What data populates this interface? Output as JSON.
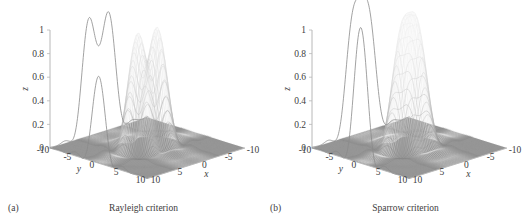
{
  "figure": {
    "panels": [
      {
        "id": "a",
        "letter": "(a)",
        "title": "Rayleigh criterion",
        "axes": {
          "z": {
            "label": "z",
            "ticks": [
              "0",
              "0.2",
              "0.4",
              "0.6",
              "0.8",
              "1"
            ],
            "values": [
              0,
              0.2,
              0.4,
              0.6,
              0.8,
              1
            ]
          },
          "y": {
            "label": "y",
            "ticks": [
              "-10",
              "-5",
              "0",
              "5",
              "10"
            ],
            "values": [
              -10,
              -5,
              0,
              5,
              10
            ]
          },
          "x": {
            "label": "x",
            "ticks": [
              "10",
              "5",
              "0",
              "-5",
              "-10"
            ],
            "values": [
              10,
              5,
              0,
              -5,
              -10
            ]
          }
        }
      },
      {
        "id": "b",
        "letter": "(b)",
        "title": "Sparrow criterion",
        "axes": {
          "z": {
            "label": "z",
            "ticks": [
              "0",
              "0.2",
              "0.4",
              "0.6",
              "0.8",
              "1"
            ],
            "values": [
              0,
              0.2,
              0.4,
              0.6,
              0.8,
              1
            ]
          },
          "y": {
            "label": "y",
            "ticks": [
              "-10",
              "-5",
              "0",
              "5",
              "10"
            ],
            "values": [
              -10,
              -5,
              0,
              5,
              10
            ]
          },
          "x": {
            "label": "x",
            "ticks": [
              "10",
              "5",
              "0",
              "-5",
              "-10"
            ],
            "values": [
              10,
              5,
              0,
              -5,
              -10
            ]
          }
        }
      }
    ]
  },
  "chart_data": [
    {
      "type": "surface",
      "panel": "a",
      "title": "Rayleigh criterion",
      "xlabel": "x",
      "ylabel": "y",
      "zlabel": "z",
      "xlim": [
        -10,
        10
      ],
      "ylim": [
        -10,
        10
      ],
      "zlim": [
        0,
        1
      ],
      "grid": false,
      "legend": null,
      "description": "Two overlapping Airy-disk point spread functions separated at the Rayleigh limit; the summed profile shows two distinct maxima with a central dip.",
      "source_separation": 3.83,
      "peak_height": 1.0,
      "central_dip_value": 0.735,
      "resolved": true,
      "profile_curve": {
        "x": [
          -10,
          -8,
          -6,
          -5,
          -4.2,
          -3.4,
          -2.6,
          -1.915,
          -1.2,
          -0.5,
          0,
          0.5,
          1.2,
          1.915,
          2.6,
          3.4,
          4.2,
          5,
          6,
          8,
          10
        ],
        "z": [
          0.01,
          0.03,
          0.12,
          0.36,
          0.68,
          0.95,
          1.07,
          1.0,
          0.85,
          0.76,
          0.735,
          0.76,
          0.85,
          1.0,
          1.07,
          0.95,
          0.68,
          0.36,
          0.12,
          0.03,
          0.01
        ]
      },
      "side_profile_curve": {
        "y": [
          -10,
          -7,
          -5,
          -3,
          -1.5,
          0,
          1.5,
          3,
          5,
          7,
          10
        ],
        "z": [
          0.01,
          0.04,
          0.12,
          0.48,
          0.92,
          1.1,
          0.92,
          0.48,
          0.12,
          0.04,
          0.01
        ]
      }
    },
    {
      "type": "surface",
      "panel": "b",
      "title": "Sparrow criterion",
      "xlabel": "x",
      "ylabel": "y",
      "zlabel": "z",
      "xlim": [
        -10,
        10
      ],
      "ylim": [
        -10,
        10
      ],
      "zlim": [
        0,
        1
      ],
      "grid": false,
      "legend": null,
      "description": "Two Airy-disk point spread functions separated at the Sparrow limit; the summed profile merges into a single flat-topped maximum with zero curvature at the center.",
      "source_separation": 2.98,
      "peak_height": 1.15,
      "central_dip_value": 1.15,
      "resolved": false,
      "profile_curve": {
        "x": [
          -10,
          -8,
          -6,
          -5,
          -4.2,
          -3.4,
          -2.6,
          -1.8,
          -1.0,
          -0.4,
          0,
          0.4,
          1.0,
          1.8,
          2.6,
          3.4,
          4.2,
          5,
          6,
          8,
          10
        ],
        "z": [
          0.01,
          0.03,
          0.12,
          0.36,
          0.7,
          1.0,
          1.12,
          1.15,
          1.15,
          1.15,
          1.15,
          1.15,
          1.15,
          1.15,
          1.12,
          1.0,
          0.7,
          0.36,
          0.12,
          0.03,
          0.01
        ]
      },
      "side_profile_curve": {
        "y": [
          -10,
          -7,
          -5,
          -3,
          -1.5,
          0,
          1.5,
          3,
          5,
          7,
          10
        ],
        "z": [
          0.01,
          0.04,
          0.12,
          0.48,
          0.95,
          1.12,
          0.95,
          0.48,
          0.12,
          0.04,
          0.01
        ]
      }
    }
  ],
  "style": {
    "mesh_color": "#7d7d7d",
    "base_color": "#9a9a9a",
    "profile_color": "#8a8a8a",
    "axis_color": "#b8b8b8",
    "text_color": "#3d3d3d"
  }
}
